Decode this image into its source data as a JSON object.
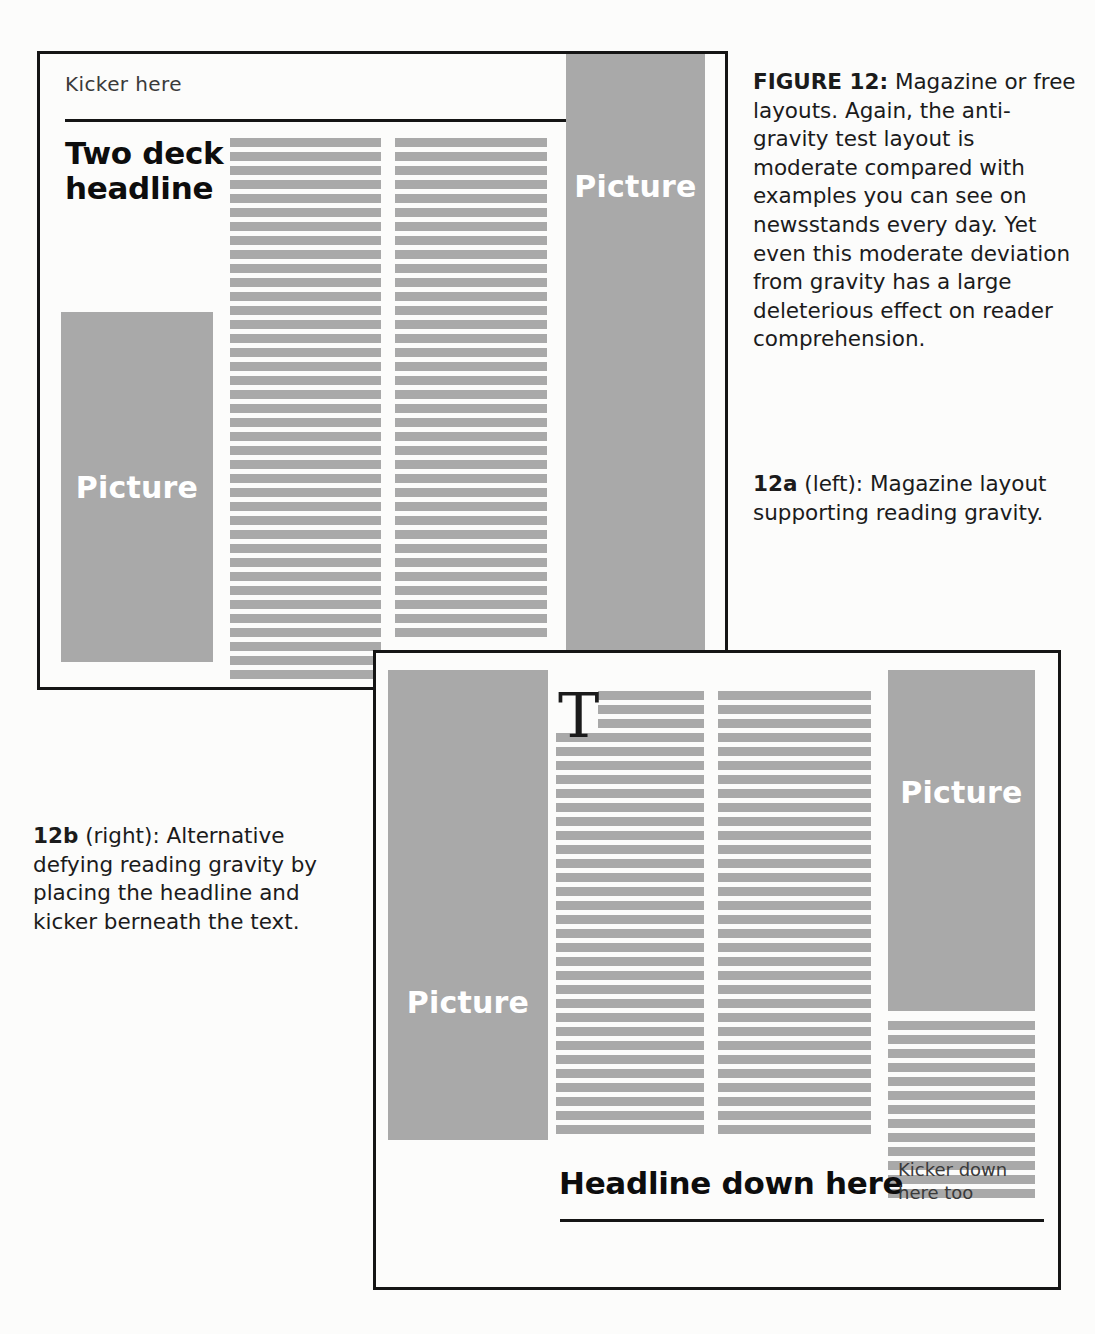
{
  "colors": {
    "greek_gray": "#a9a9a9",
    "ink": "#151515",
    "paper": "#fcfcfb",
    "picture_label": "#ffffff"
  },
  "captions": {
    "figure_label": "FIGURE 12:",
    "figure_text": " Magazine or free layouts. Again, the anti-gravity test layout is moderate compared with examples you can see on newsstands every day. Yet even this moderate deviation from gravity has a large deleterious effect on reader comprehension.",
    "a_label": "12a",
    "a_text": " (left): Magazine layout supporting reading gravity.",
    "b_label": "12b",
    "b_text": " (right): Alternative defying reading gravity by placing the headline and kicker berneath the text."
  },
  "panel_a": {
    "kicker": "Kicker here",
    "headline": "Two deck headline",
    "picture_left_label": "Picture",
    "picture_right_label": "Picture"
  },
  "panel_b": {
    "dropcap": "T",
    "headline": "Headline down here",
    "kicker": "Kicker down here too",
    "picture_left_label": "Picture",
    "picture_right_label": "Picture"
  },
  "layout": {
    "panel_a": {
      "x": 37,
      "y": 51,
      "w": 691,
      "h": 639,
      "picture_left": {
        "x": 21,
        "y": 258,
        "w": 152,
        "h": 350
      },
      "picture_right": {
        "x": 526,
        "y": 0,
        "w": 139,
        "h": 596
      },
      "columns": [
        {
          "x": 190,
          "y": 84,
          "w": 151,
          "rows": 39
        },
        {
          "x": 355,
          "y": 84,
          "w": 152,
          "rows": 36
        }
      ]
    },
    "panel_b": {
      "x": 373,
      "y": 650,
      "w": 688,
      "h": 640,
      "picture_left": {
        "x": 12,
        "y": 17,
        "w": 160,
        "h": 470
      },
      "picture_right": {
        "x": 512,
        "y": 17,
        "w": 147,
        "h": 341
      },
      "columns": [
        {
          "x": 180,
          "y": 38,
          "w": 148,
          "rows": 32
        },
        {
          "x": 342,
          "y": 38,
          "w": 153,
          "rows": 32
        },
        {
          "x": 512,
          "y": 368,
          "w": 147,
          "rows": 13
        }
      ],
      "dropcap_lines_indented": 3
    },
    "bar_height": 9,
    "bar_pitch": 14
  }
}
